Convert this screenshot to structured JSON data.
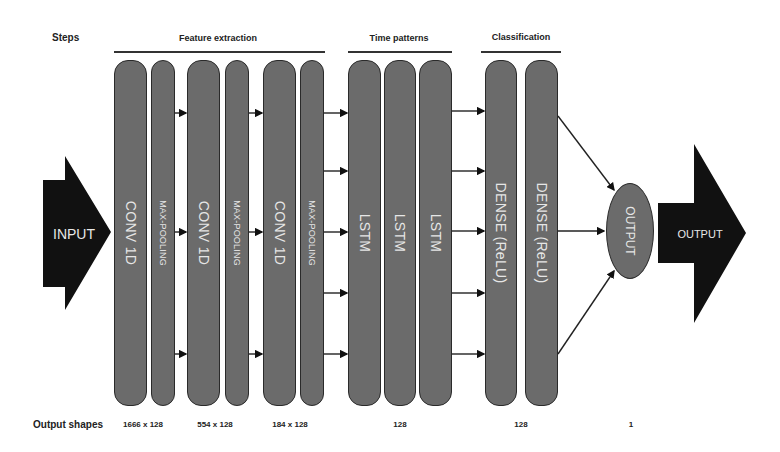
{
  "header": {
    "steps_label": "Steps",
    "groups": [
      {
        "label": "Feature extraction"
      },
      {
        "label": "Time patterns"
      },
      {
        "label": "Classification"
      }
    ]
  },
  "input": {
    "label": "INPUT"
  },
  "layers": [
    {
      "label": "CONV 1D",
      "type": "conv"
    },
    {
      "label": "MAX-POOLING",
      "type": "pool"
    },
    {
      "label": "CONV 1D",
      "type": "conv"
    },
    {
      "label": "MAX-POOLING",
      "type": "pool"
    },
    {
      "label": "CONV 1D",
      "type": "conv"
    },
    {
      "label": "MAX-POOLING",
      "type": "pool"
    },
    {
      "label": "LSTM",
      "type": "lstm"
    },
    {
      "label": "LSTM",
      "type": "lstm"
    },
    {
      "label": "LSTM",
      "type": "lstm"
    },
    {
      "label": "DENSE (ReLU)",
      "type": "dense"
    },
    {
      "label": "DENSE (ReLU)",
      "type": "dense"
    }
  ],
  "output_node": {
    "label": "OUTPUT"
  },
  "output_arrow": {
    "label": "OUTPUT"
  },
  "footer": {
    "label": "Output shapes",
    "shapes": [
      "1666 x 128",
      "554 x 128",
      "184 x 128",
      "128",
      "128",
      "1"
    ]
  },
  "colors": {
    "block_fill": "#6b6b6b",
    "block_border": "#2a2a2a",
    "block_text": "#e6e6e6",
    "arrow_fill": "#111111",
    "background": "#ffffff"
  }
}
